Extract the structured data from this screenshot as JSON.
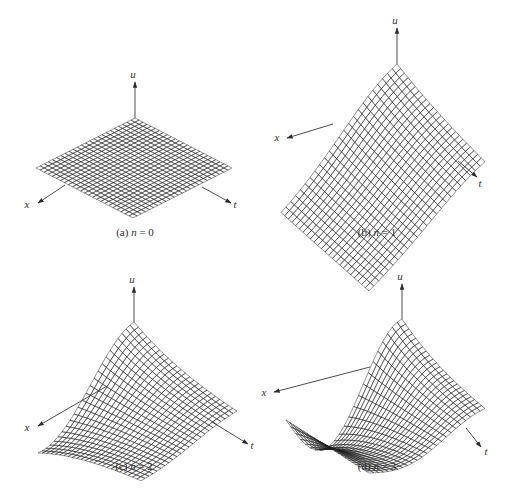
{
  "figure": {
    "width": 513,
    "height": 490,
    "background": "#ffffff",
    "surface_colors": {
      "light": "#bdbdbd",
      "mid": "#6e6e6e",
      "dark": "#2a2a2a"
    },
    "grid_divisions": 24
  },
  "panels": [
    {
      "id": "a",
      "caption_prefix": "(a)",
      "caption_var": "n",
      "caption_eq": " = 0",
      "n": 0,
      "axis_labels": {
        "u": "u",
        "x": "x",
        "t": "t"
      },
      "geometry": {
        "origin": [
          135,
          118
        ],
        "x_end": [
          36,
          168
        ],
        "t_end": [
          232,
          168
        ],
        "u_scale": 0,
        "u_axis": {
          "from": [
            135,
            118
          ],
          "to": [
            135,
            82
          ],
          "label": [
            133,
            78
          ]
        },
        "x_axis": {
          "from": [
            65,
            185
          ],
          "to": [
            38,
            203
          ],
          "label": [
            27,
            208
          ]
        },
        "t_axis": {
          "from": [
            202,
            187
          ],
          "to": [
            231,
            203
          ],
          "label": [
            235,
            208
          ]
        },
        "caption_pos": [
          135,
          236
        ]
      }
    },
    {
      "id": "b",
      "caption_prefix": "(b)",
      "caption_var": "n",
      "caption_eq": " = 1",
      "n": 1,
      "axis_labels": {
        "u": "u",
        "x": "x",
        "t": "t"
      },
      "geometry": {
        "origin": [
          397,
          114
        ],
        "x_end": [
          281,
          218
        ],
        "t_end": [
          485,
          190
        ],
        "u_scale": 50,
        "u_axis": {
          "from": [
            397,
            64
          ],
          "to": [
            397,
            28
          ],
          "label": [
            395,
            24
          ]
        },
        "x_axis": {
          "from": [
            333,
            124
          ],
          "to": [
            287,
            138
          ],
          "label": [
            277,
            141
          ]
        },
        "t_axis": {
          "from": [
            458,
            161
          ],
          "to": [
            477,
            177
          ],
          "label": [
            480,
            187
          ]
        },
        "caption_pos": [
          377,
          236
        ]
      }
    },
    {
      "id": "c",
      "caption_prefix": "(c)",
      "caption_var": "n",
      "caption_eq": " = 2",
      "n": 2,
      "axis_labels": {
        "u": "u",
        "x": "x",
        "t": "t"
      },
      "geometry": {
        "origin": [
          134,
          366
        ],
        "x_end": [
          38,
          420
        ],
        "t_end": [
          237,
          420
        ],
        "u_scale": 44,
        "u_axis": {
          "from": [
            134,
            322
          ],
          "to": [
            134,
            287
          ],
          "label": [
            132,
            283
          ]
        },
        "x_axis": {
          "from": [
            107,
            386
          ],
          "to": [
            38,
            426
          ],
          "label": [
            27,
            431
          ]
        },
        "t_axis": {
          "from": [
            212,
            422
          ],
          "to": [
            248,
            444
          ],
          "label": [
            252,
            449
          ]
        },
        "caption_pos": [
          134,
          470
        ]
      }
    },
    {
      "id": "d",
      "caption_prefix": "(d)",
      "caption_var": "n",
      "caption_eq": " = 3",
      "n": 3,
      "axis_labels": {
        "u": "u",
        "x": "x",
        "t": "t"
      },
      "geometry": {
        "origin": [
          402,
          366
        ],
        "x_end": [
          286,
          420
        ],
        "t_end": [
          485,
          419
        ],
        "u_scale": 47,
        "u_axis": {
          "from": [
            402,
            319
          ],
          "to": [
            402,
            284
          ],
          "label": [
            400,
            280
          ]
        },
        "x_axis": {
          "from": [
            370,
            367
          ],
          "to": [
            274,
            392
          ],
          "label": [
            264,
            396
          ]
        },
        "t_axis": {
          "from": [
            466,
            428
          ],
          "to": [
            481,
            447
          ],
          "label": [
            486,
            455
          ]
        },
        "caption_pos": [
          377,
          470
        ]
      }
    }
  ]
}
